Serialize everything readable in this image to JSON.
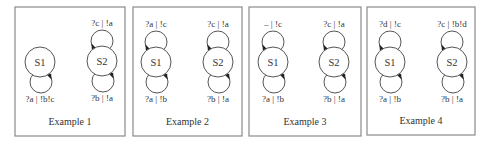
{
  "diagram": {
    "type": "state-machine-examples",
    "panels": [
      {
        "caption": "Example 1",
        "frame": {
          "x": 15,
          "y": 7,
          "w": 110,
          "h": 129
        },
        "states": [
          {
            "name": "S1",
            "cx": 40,
            "cy": 62,
            "top_loop": null,
            "bottom_loop": "?a | !b!c"
          },
          {
            "name": "S2",
            "cx": 102,
            "cy": 61,
            "top_loop": "?c | !a",
            "bottom_loop": "?b | !a"
          }
        ]
      },
      {
        "caption": "Example 2",
        "frame": {
          "x": 133,
          "y": 7,
          "w": 109,
          "h": 129
        },
        "states": [
          {
            "name": "S1",
            "cx": 156,
            "cy": 62,
            "top_loop": "?a | !c",
            "bottom_loop": "?a | !b"
          },
          {
            "name": "S2",
            "cx": 218,
            "cy": 62,
            "top_loop": "?c | !a",
            "bottom_loop": "?b | !a"
          }
        ]
      },
      {
        "caption": "Example 3",
        "frame": {
          "x": 249,
          "y": 7,
          "w": 112,
          "h": 129
        },
        "states": [
          {
            "name": "S1",
            "cx": 273,
            "cy": 62,
            "top_loop": "– | !c",
            "bottom_loop": "?a | !b"
          },
          {
            "name": "S2",
            "cx": 334,
            "cy": 62,
            "top_loop": "?c | !a",
            "bottom_loop": "?b | !a"
          }
        ]
      },
      {
        "caption": "Example 4",
        "frame": {
          "x": 367,
          "y": 7,
          "w": 108,
          "h": 128
        },
        "states": [
          {
            "name": "S1",
            "cx": 390,
            "cy": 62,
            "top_loop": "?d | !c",
            "bottom_loop": "?a | !b"
          },
          {
            "name": "S2",
            "cx": 452,
            "cy": 62,
            "top_loop": "?c | !b!d",
            "bottom_loop": "?b | !a"
          }
        ]
      }
    ],
    "style": {
      "state_radius": 15,
      "loop_radius": 11,
      "frame_color": "#8a8a8a",
      "line_color": "#555555",
      "text_color": "#333333"
    }
  }
}
